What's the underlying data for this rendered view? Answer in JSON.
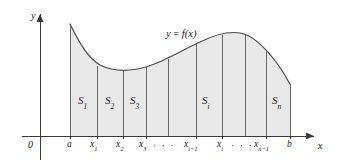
{
  "figure": {
    "kind": "riemann-sum-area-diagram",
    "title_visible": false,
    "colors": {
      "region_fill": "#e9e9e9",
      "curve_stroke": "#4a4a4a",
      "axis_stroke": "#3a3a3a",
      "divider_stroke": "#6a6a6a",
      "text": "#1a1a1a",
      "background": "#ffffff"
    }
  },
  "axes": {
    "y_axis_label": "y",
    "x_axis_label": "x",
    "origin_label": "0",
    "x_axis_y_px": 136,
    "y_axis_x_px": 40
  },
  "curve": {
    "label_prefix": "y",
    "label_equals": "=",
    "label_function": "f(x)",
    "label_full": "y = f(x)",
    "description": "smooth curve: high at a, dips to a minimum near x3, rises to a maximum between x_i and x_n-1, then falls toward b"
  },
  "ticks": [
    {
      "name": "a",
      "base": "a",
      "sub": "",
      "x_px": 70,
      "label_x_px": 67,
      "top_y_px": 24
    },
    {
      "name": "x1",
      "base": "x",
      "sub": "1",
      "x_px": 97,
      "label_x_px": 90,
      "top_y_px": 40
    },
    {
      "name": "x2",
      "base": "x",
      "sub": "2",
      "x_px": 123,
      "label_x_px": 116,
      "top_y_px": 57
    },
    {
      "name": "x3",
      "base": "x",
      "sub": "3",
      "x_px": 146,
      "label_x_px": 139,
      "top_y_px": 67
    },
    {
      "name": "xi-1",
      "base": "x",
      "sub": "i−1",
      "x_px": 196,
      "label_x_px": 184,
      "top_y_px": 53
    },
    {
      "name": "xi",
      "base": "x",
      "sub": "i",
      "x_px": 222,
      "label_x_px": 216,
      "top_y_px": 39
    },
    {
      "name": "xn-1",
      "base": "x",
      "sub": "n−1",
      "x_px": 266,
      "label_x_px": 254,
      "top_y_px": 44
    },
    {
      "name": "b",
      "base": "b",
      "sub": "",
      "x_px": 290,
      "label_x_px": 287,
      "top_y_px": 84
    }
  ],
  "interior_dividers_px": [
    168,
    245
  ],
  "ellipses": [
    {
      "text": "· · ·",
      "x_px": 153,
      "y_px": 141
    },
    {
      "text": "· · ·",
      "x_px": 230,
      "y_px": 141
    }
  ],
  "regions": [
    {
      "name": "S1",
      "base": "S",
      "sub": "1",
      "label_x_px": 79,
      "label_y_px": 96
    },
    {
      "name": "S2",
      "base": "S",
      "sub": "2",
      "label_x_px": 105,
      "label_y_px": 96
    },
    {
      "name": "S3",
      "base": "S",
      "sub": "3",
      "label_x_px": 130,
      "label_y_px": 96
    },
    {
      "name": "Si",
      "base": "S",
      "sub": "i",
      "label_x_px": 202,
      "label_y_px": 96
    },
    {
      "name": "Sn",
      "base": "S",
      "sub": "n",
      "label_x_px": 272,
      "label_y_px": 96
    }
  ],
  "curve_label_pos": {
    "x_px": 166,
    "y_px": 30
  }
}
